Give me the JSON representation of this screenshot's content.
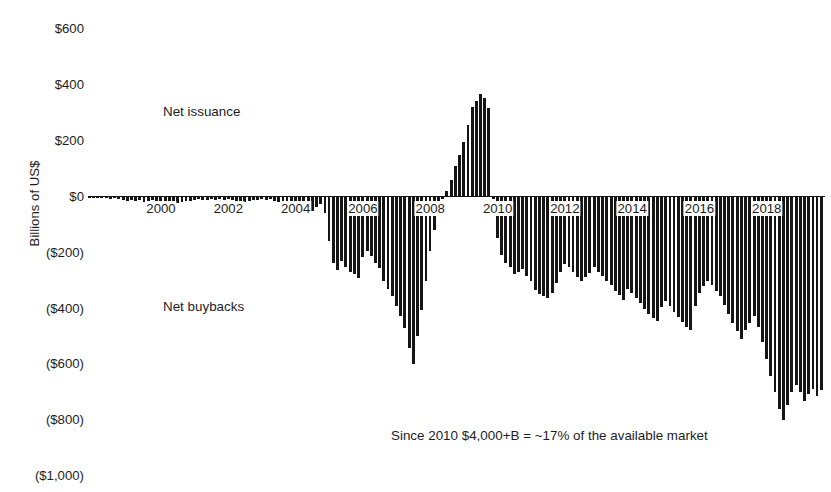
{
  "figure": {
    "clipped_title": "",
    "y_axis_title": "Billions of US$"
  },
  "annotations": {
    "issuance": "Net issuance",
    "buybacks": "Net buybacks",
    "footnote": "Since 2010 $4,000+B = ~17% of the available market"
  },
  "chart_data": {
    "type": "bar",
    "title": "",
    "subtitle": "",
    "xlabel": "",
    "ylabel": "Billions of US$",
    "ylim": [
      -1000,
      700
    ],
    "ytick_values": [
      600,
      400,
      200,
      0,
      -200,
      -400,
      -600,
      -800,
      -1000
    ],
    "ytick_labels": [
      "$600",
      "$400",
      "$200",
      "$0",
      "($200)",
      "($400)",
      "($600)",
      "($800)",
      "($1,000)"
    ],
    "xtick_values": [
      2000,
      2002,
      2004,
      2006,
      2008,
      2010,
      2012,
      2014,
      2016,
      2018
    ],
    "xtick_labels": [
      "2000",
      "2002",
      "2004",
      "2006",
      "2008",
      "2010",
      "2012",
      "2014",
      "2016",
      "2018"
    ],
    "xlim": [
      1998.0,
      2019.9
    ],
    "grid": false,
    "legend": "none",
    "bar_color": "#151515",
    "series_name": "Net equity issuance / buybacks (rolling 4-quarter)",
    "units": "Billions of US$",
    "x": [
      1998.0,
      1998.12,
      1998.25,
      1998.37,
      1998.5,
      1998.62,
      1998.75,
      1998.87,
      1999.0,
      1999.12,
      1999.25,
      1999.37,
      1999.5,
      1999.62,
      1999.75,
      1999.87,
      2000.0,
      2000.12,
      2000.25,
      2000.37,
      2000.5,
      2000.62,
      2000.75,
      2000.87,
      2001.0,
      2001.12,
      2001.25,
      2001.37,
      2001.5,
      2001.62,
      2001.75,
      2001.87,
      2002.0,
      2002.12,
      2002.25,
      2002.37,
      2002.5,
      2002.62,
      2002.75,
      2002.87,
      2003.0,
      2003.12,
      2003.25,
      2003.37,
      2003.5,
      2003.62,
      2003.75,
      2003.87,
      2004.0,
      2004.12,
      2004.25,
      2004.37,
      2004.5,
      2004.62,
      2004.75,
      2004.87,
      2005.0,
      2005.12,
      2005.25,
      2005.37,
      2005.5,
      2005.62,
      2005.75,
      2005.87,
      2006.0,
      2006.12,
      2006.25,
      2006.37,
      2006.5,
      2006.62,
      2006.75,
      2006.87,
      2007.0,
      2007.12,
      2007.25,
      2007.37,
      2007.5,
      2007.62,
      2007.75,
      2007.87,
      2008.0,
      2008.12,
      2008.25,
      2008.37,
      2008.5,
      2008.62,
      2008.75,
      2008.87,
      2009.0,
      2009.12,
      2009.25,
      2009.37,
      2009.5,
      2009.62,
      2009.75,
      2009.87,
      2010.0,
      2010.12,
      2010.25,
      2010.37,
      2010.5,
      2010.62,
      2010.75,
      2010.87,
      2011.0,
      2011.12,
      2011.25,
      2011.37,
      2011.5,
      2011.62,
      2011.75,
      2011.87,
      2012.0,
      2012.12,
      2012.25,
      2012.37,
      2012.5,
      2012.62,
      2012.75,
      2012.87,
      2013.0,
      2013.12,
      2013.25,
      2013.37,
      2013.5,
      2013.62,
      2013.75,
      2013.87,
      2014.0,
      2014.12,
      2014.25,
      2014.37,
      2014.5,
      2014.62,
      2014.75,
      2014.87,
      2015.0,
      2015.12,
      2015.25,
      2015.37,
      2015.5,
      2015.62,
      2015.75,
      2015.87,
      2016.0,
      2016.12,
      2016.25,
      2016.37,
      2016.5,
      2016.62,
      2016.75,
      2016.87,
      2017.0,
      2017.12,
      2017.25,
      2017.37,
      2017.5,
      2017.62,
      2017.75,
      2017.87,
      2018.0,
      2018.12,
      2018.25,
      2018.37,
      2018.5,
      2018.62,
      2018.75,
      2018.87,
      2019.0,
      2019.12,
      2019.25,
      2019.37,
      2019.5,
      2019.62,
      2019.75
    ],
    "values": [
      -4,
      -5,
      -3,
      -6,
      -4,
      -8,
      -6,
      -10,
      -12,
      -14,
      -11,
      -16,
      -13,
      -18,
      -15,
      -12,
      -22,
      -28,
      -25,
      -30,
      -26,
      -22,
      -18,
      -16,
      -14,
      -12,
      -10,
      -13,
      -11,
      -9,
      -12,
      -10,
      -11,
      -9,
      -13,
      -16,
      -14,
      -18,
      -16,
      -13,
      -11,
      -9,
      -12,
      -10,
      -14,
      -18,
      -24,
      -30,
      -44,
      -58,
      -46,
      -34,
      -30,
      -52,
      -38,
      -26,
      -58,
      -160,
      -238,
      -262,
      -230,
      -252,
      -268,
      -276,
      -290,
      -216,
      -196,
      -212,
      -238,
      -256,
      -300,
      -330,
      -356,
      -392,
      -428,
      -470,
      -540,
      -598,
      -500,
      -404,
      -300,
      -196,
      -120,
      -56,
      -10,
      20,
      58,
      108,
      148,
      196,
      256,
      320,
      342,
      368,
      352,
      318,
      -8,
      -148,
      -208,
      -236,
      -250,
      -276,
      -268,
      -258,
      -282,
      -300,
      -334,
      -348,
      -356,
      -364,
      -346,
      -310,
      -268,
      -240,
      -252,
      -270,
      -286,
      -302,
      -288,
      -272,
      -252,
      -268,
      -284,
      -300,
      -316,
      -336,
      -352,
      -368,
      -330,
      -346,
      -362,
      -382,
      -400,
      -418,
      -434,
      -446,
      -396,
      -372,
      -392,
      -412,
      -432,
      -448,
      -466,
      -478,
      -392,
      -346,
      -318,
      -300,
      -316,
      -336,
      -356,
      -388,
      -420,
      -452,
      -480,
      -508,
      -476,
      -450,
      -428,
      -466,
      -520,
      -580,
      -640,
      -700,
      -760,
      -800,
      -744,
      -700,
      -672,
      -700,
      -730,
      -706,
      -686,
      -712,
      -690
    ]
  }
}
